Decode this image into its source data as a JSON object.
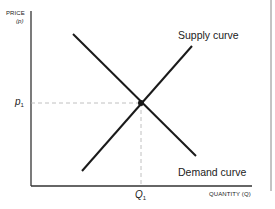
{
  "diagram": {
    "y_axis": {
      "label": "PRICE",
      "symbol": "(p)"
    },
    "x_axis": {
      "label": "QUANTITY (Q)"
    },
    "equilibrium_price": {
      "letter": "p",
      "subscript": "1"
    },
    "equilibrium_quantity": {
      "letter": "Q",
      "subscript": "1"
    },
    "curves": [
      {
        "name": "Supply curve"
      },
      {
        "name": "Demand curve"
      }
    ],
    "colors": {
      "line": "#1a1a1a",
      "guide": "#b0b0b0",
      "axis": "#333333"
    }
  }
}
